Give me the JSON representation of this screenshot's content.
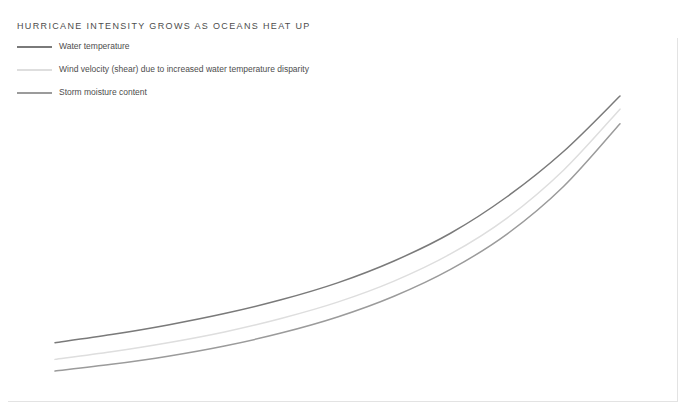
{
  "chart_data": {
    "type": "line",
    "title": "Hurricane intensity grows as oceans heat up",
    "xlabel": "",
    "ylabel": "",
    "grid": false,
    "legend_position": "top-left",
    "axis_ranges": {
      "x": [
        0,
        1
      ],
      "y": [
        0,
        1
      ]
    },
    "x": [
      0,
      0.1,
      0.2,
      0.3,
      0.4,
      0.5,
      0.6,
      0.7,
      0.8,
      0.9,
      1
    ],
    "series": [
      {
        "name": "Water temperature",
        "color": "#7a7a7a",
        "values": [
          0.155,
          0.183,
          0.216,
          0.255,
          0.302,
          0.36,
          0.435,
          0.53,
          0.655,
          0.81,
          1.0
        ]
      },
      {
        "name": "Wind velocity (shear) due to increased water temperature disparity",
        "color": "#dedede",
        "values": [
          0.098,
          0.124,
          0.155,
          0.192,
          0.238,
          0.294,
          0.366,
          0.459,
          0.582,
          0.746,
          0.955
        ]
      },
      {
        "name": "Storm moisture content",
        "color": "#9b9b9b",
        "values": [
          0.058,
          0.081,
          0.109,
          0.144,
          0.188,
          0.243,
          0.314,
          0.406,
          0.527,
          0.69,
          0.905
        ]
      }
    ]
  },
  "header": {
    "title": "HURRICANE INTENSITY GROWS AS OCEANS HEAT UP"
  },
  "legend": {
    "items": [
      {
        "label": "Water temperature",
        "color": "#7a7a7a"
      },
      {
        "label": "Wind velocity (shear) due to increased water temperature disparity",
        "color": "#dedede"
      },
      {
        "label": "Storm moisture content",
        "color": "#9b9b9b"
      }
    ]
  },
  "colors": {
    "frame": "#e3e3e3",
    "title_text": "#4d4d4d",
    "legend_text": "#4d4d4d",
    "background": "#ffffff"
  }
}
